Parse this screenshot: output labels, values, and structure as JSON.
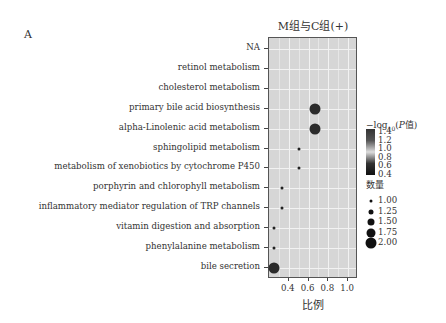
{
  "panel_label": "A",
  "chart_data": {
    "type": "scatter",
    "title": "M组与C组(+)",
    "xlabel": "比例",
    "ylabel": "",
    "xlim": [
      0.2,
      1.1
    ],
    "xticks": [
      "0.4",
      "0.6",
      "0.8",
      "1.0"
    ],
    "grid": true,
    "categories": [
      "NA",
      "retinol metabolism",
      "cholesterol metabolism",
      "primary bile acid biosynthesis",
      "alpha-Linolenic acid metabolism",
      "sphingolipid metabolism",
      "metabolism of xenobiotics by cytochrome P450",
      "porphyrin and chlorophyll metabolism",
      "inflammatory mediator regulation of TRP channels",
      "vitamin digestion and absorption",
      "phenylalanine metabolism",
      "bile secretion"
    ],
    "points": [
      {
        "category": "primary bile acid biosynthesis",
        "x": 0.67,
        "count": 2.0,
        "neglog10p": 1.3
      },
      {
        "category": "alpha-Linolenic acid metabolism",
        "x": 0.67,
        "count": 2.0,
        "neglog10p": 1.3
      },
      {
        "category": "sphingolipid metabolism",
        "x": 0.5,
        "count": 1.0,
        "neglog10p": 0.7
      },
      {
        "category": "metabolism of xenobiotics by cytochrome P450",
        "x": 0.5,
        "count": 1.0,
        "neglog10p": 0.7
      },
      {
        "category": "porphyrin and chlorophyll metabolism",
        "x": 0.33,
        "count": 1.0,
        "neglog10p": 0.6
      },
      {
        "category": "inflammatory mediator regulation of TRP channels",
        "x": 0.33,
        "count": 1.0,
        "neglog10p": 0.6
      },
      {
        "category": "vitamin digestion and absorption",
        "x": 0.25,
        "count": 1.0,
        "neglog10p": 0.5
      },
      {
        "category": "phenylalanine metabolism",
        "x": 0.25,
        "count": 1.0,
        "neglog10p": 0.5
      },
      {
        "category": "bile secretion",
        "x": 0.25,
        "count": 2.0,
        "neglog10p": 1.3
      }
    ],
    "legend": {
      "color_title": "−log10(P值)",
      "color_ticks": [
        "1.4",
        "1.2",
        "1.0",
        "0.8",
        "0.6",
        "0.4"
      ],
      "size_title": "数量",
      "size_ticks": [
        "1.00",
        "1.25",
        "1.50",
        "1.75",
        "2.00"
      ],
      "position": "right"
    }
  }
}
